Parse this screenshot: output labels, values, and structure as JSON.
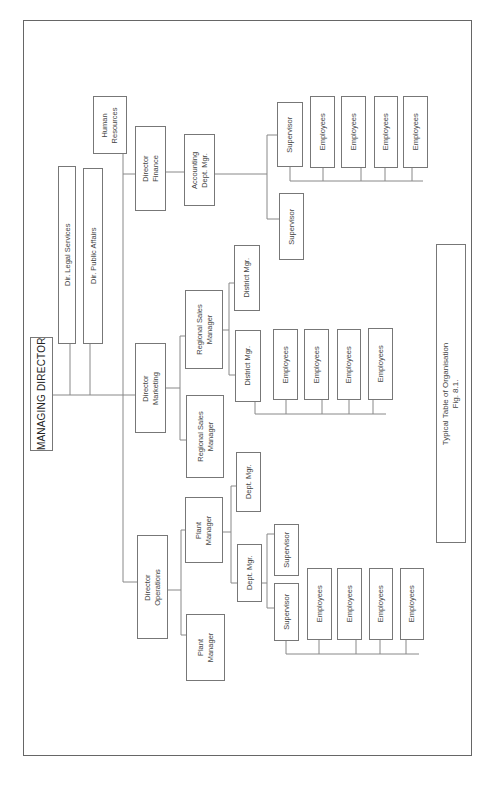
{
  "title": "Typical Table of Organisation",
  "figure": "Fig. 8.1.",
  "colors": {
    "line": "#888888",
    "box_border": "#777777",
    "text": "#444444",
    "background": "#ffffff"
  },
  "nodes": {
    "md": {
      "lines": [
        "MANAGING DIRECTOR"
      ]
    },
    "legal": {
      "lines": [
        "Dir. Legal Services"
      ]
    },
    "public": {
      "lines": [
        "Dir. Public Affairs"
      ]
    },
    "hr": {
      "lines": [
        "Human",
        "Resources"
      ]
    },
    "finance": {
      "lines": [
        "Director",
        "Finance"
      ]
    },
    "accounting": {
      "lines": [
        "Accounting",
        "Dept. Mgr."
      ]
    },
    "fin_sup1": {
      "lines": [
        "Supervisor"
      ]
    },
    "fin_sup2": {
      "lines": [
        "Supervisor"
      ]
    },
    "fin_emp1": {
      "lines": [
        "Employees"
      ]
    },
    "fin_emp2": {
      "lines": [
        "Employees"
      ]
    },
    "fin_emp3": {
      "lines": [
        "Employees"
      ]
    },
    "fin_emp4": {
      "lines": [
        "Employees"
      ]
    },
    "marketing": {
      "lines": [
        "Director",
        "Marketing"
      ]
    },
    "rsm1": {
      "lines": [
        "Regional Sales",
        "Manager"
      ]
    },
    "rsm2": {
      "lines": [
        "Regional Sales",
        "Manager"
      ]
    },
    "dist1": {
      "lines": [
        "District Mgr."
      ]
    },
    "dist2": {
      "lines": [
        "District Mgr."
      ]
    },
    "mkt_emp1": {
      "lines": [
        "Employees"
      ]
    },
    "mkt_emp2": {
      "lines": [
        "Employees"
      ]
    },
    "mkt_emp3": {
      "lines": [
        "Employees"
      ]
    },
    "mkt_emp4": {
      "lines": [
        "Employees"
      ]
    },
    "operations": {
      "lines": [
        "Director",
        "Operations"
      ]
    },
    "plant1": {
      "lines": [
        "Plant",
        "Manager"
      ]
    },
    "plant2": {
      "lines": [
        "Plant",
        "Manager"
      ]
    },
    "dept1": {
      "lines": [
        "Dept. Mgr."
      ]
    },
    "dept2": {
      "lines": [
        "Dept. Mgr."
      ]
    },
    "ops_sup1": {
      "lines": [
        "Supervisor"
      ]
    },
    "ops_sup2": {
      "lines": [
        "Supervisor"
      ]
    },
    "ops_emp1": {
      "lines": [
        "Employees"
      ]
    },
    "ops_emp2": {
      "lines": [
        "Employees"
      ]
    },
    "ops_emp3": {
      "lines": [
        "Employees"
      ]
    },
    "ops_emp4": {
      "lines": [
        "Employees"
      ]
    },
    "caption": {
      "lines": [
        "Typical Table of Organisation",
        "Fig. 8.1."
      ]
    }
  }
}
